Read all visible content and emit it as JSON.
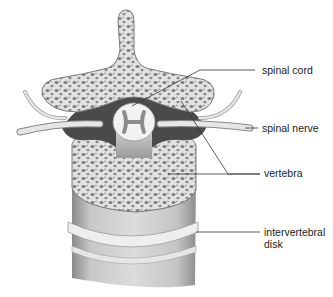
{
  "diagram": {
    "labels": [
      {
        "id": "spinal-cord",
        "text": "spinal cord"
      },
      {
        "id": "spinal-nerve",
        "text": "spinal nerve"
      },
      {
        "id": "vertebra",
        "text": "vertebra"
      },
      {
        "id": "intervertebral-disk",
        "line1": "intervertebral",
        "line2": "disk"
      }
    ],
    "colors": {
      "bone_fill": "#e4e4e4",
      "bone_pores": "#7a7a7a",
      "dark_canal": "#4a4a4a",
      "cord": "#f4f4f4",
      "column_shade": "#b8b8b8",
      "leader_line": "#333333"
    }
  }
}
